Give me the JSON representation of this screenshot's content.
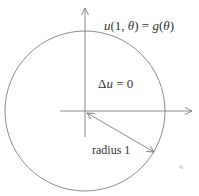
{
  "diagram": {
    "boundary_label": "u(1, θ) = g(θ)",
    "boundary_label_parts": {
      "u": "u",
      "args_open": "(1, ",
      "theta1": "θ",
      "args_close": ") = ",
      "g": "g",
      "paren_open": "(",
      "theta2": "θ",
      "paren_close": ")"
    },
    "equation_label": "Δu = 0",
    "equation_parts": {
      "delta": "Δ",
      "u": "u",
      "rest": " = 0"
    },
    "radius_label": "radius 1",
    "colors": {
      "stroke": "#6e6e6e",
      "text": "#333333",
      "background": "#ffffff"
    },
    "geometry": {
      "circle": {
        "cx": 85,
        "cy": 111,
        "r": 80
      },
      "vertical_axis": {
        "x": 85,
        "y1": 137,
        "y2": 7
      },
      "horizontal_axis": {
        "y": 111,
        "x1": 60,
        "x2": 193
      },
      "radius_arrow": {
        "x1": 86,
        "y1": 112,
        "x2": 154,
        "y2": 153
      }
    }
  }
}
